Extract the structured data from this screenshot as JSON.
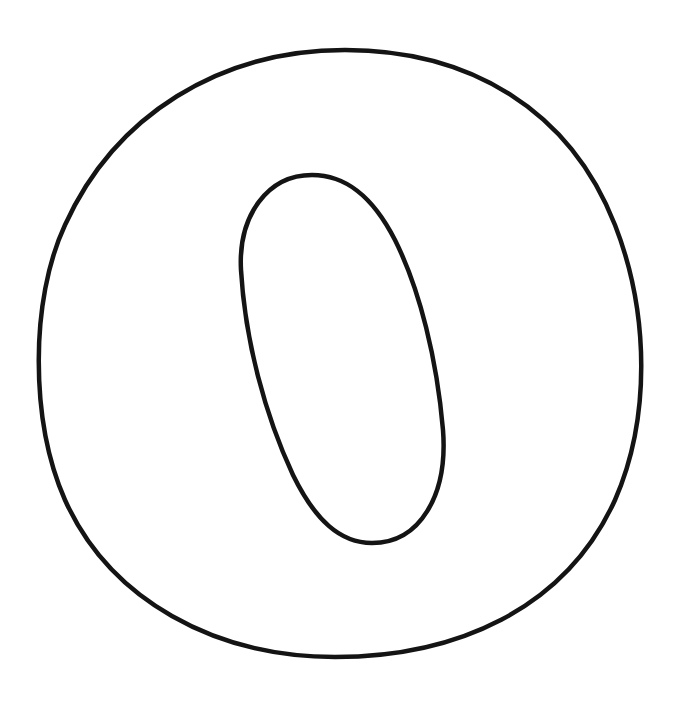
{
  "drawing": {
    "letter": "O",
    "stroke_color": "#141414",
    "background_color": "#ffffff",
    "stroke_width": 4.5,
    "outer_path": "M 345 50 C 470 50 570 110 615 225 C 650 315 650 420 615 500 C 565 610 455 657 335 657 C 215 657 110 600 65 500 C 30 420 30 300 65 225 C 115 115 220 50 345 50 Z",
    "inner_path": "M 312 175 C 345 175 372 195 395 240 C 420 290 437 360 443 430 C 448 495 420 543 372 543 C 340 543 315 520 293 475 C 265 415 245 340 241 270 C 238 215 268 175 312 175 Z"
  }
}
